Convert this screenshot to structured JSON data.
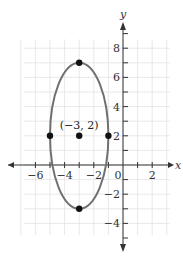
{
  "chart_data": {
    "type": "scatter",
    "title": "",
    "xlabel": "x",
    "ylabel": "y",
    "xlim": [
      -7,
      3
    ],
    "ylim": [
      -5,
      9
    ],
    "grid": true,
    "x_ticks": [
      -6,
      -4,
      -2,
      0,
      2
    ],
    "x_tick_labels": [
      "−6",
      "−4",
      "−2",
      "0",
      "2"
    ],
    "y_ticks": [
      -4,
      -2,
      2,
      4,
      6,
      8
    ],
    "y_tick_labels": [
      "−4",
      "−2",
      "2",
      "4",
      "6",
      "8"
    ],
    "curve": {
      "shape": "ellipse",
      "center": [
        -3,
        2
      ],
      "semi_axis_horizontal": 2,
      "semi_axis_vertical": 5,
      "equation": "(x+3)^2/4 + (y-2)^2/25 = 1",
      "color": "#707070"
    },
    "points": [
      {
        "x": -3,
        "y": 7,
        "label": ""
      },
      {
        "x": -3,
        "y": -3,
        "label": ""
      },
      {
        "x": -5,
        "y": 2,
        "label": ""
      },
      {
        "x": -1,
        "y": 2,
        "label": ""
      },
      {
        "x": -3,
        "y": 2,
        "label": "(−3, 2)"
      }
    ],
    "annotations": [
      "(−3, 2)"
    ]
  },
  "labels": {
    "x_axis": "x",
    "y_axis": "y",
    "center_label": "(−3, 2)"
  },
  "colors": {
    "grid": "#e2e2e2",
    "axis": "#333333",
    "curve": "#707070",
    "point": "#111111"
  }
}
